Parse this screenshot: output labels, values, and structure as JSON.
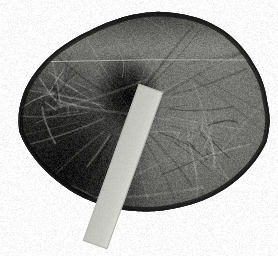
{
  "image": {
    "title": "Grayscale specimen photograph with scale bar",
    "kind": "natural-image",
    "width": 278,
    "height": 256,
    "background_color": "#ffffff",
    "description": "Grayscale close-up photograph of a rounded organic specimen resembling a leaf or biological tissue, photographed against a plain white background, with a light gray rectangular scale marker laid diagonally across it."
  },
  "specimen": {
    "name": "organic-specimen",
    "shape": "rounded irregular oval",
    "orientation_note": "wider than tall, apex toward upper center, tapering toward lower left",
    "surface": "matte, wrinkled, with vein-like striations and shallow folds",
    "rim_color": "#1a1a1a",
    "body_dark_color": "#2e2e2e",
    "body_mid_color": "#5a5a58",
    "body_light_color": "#8f8f8a",
    "highlight_color": "#a8a8a2",
    "bounds": {
      "left": 22,
      "top": 12,
      "right": 268,
      "bottom": 220
    },
    "features": [
      {
        "name": "central-depression",
        "label": "Dark central hollow",
        "center_x": 128,
        "center_y": 96,
        "radius_x": 34,
        "radius_y": 44,
        "color": "#141414"
      },
      {
        "name": "horizontal-crack-line",
        "label": "Thin light fissure crossing specimen",
        "start_x": 28,
        "start_y": 62,
        "end_x": 266,
        "end_y": 60,
        "color": "#b9b9b4",
        "thickness": 1
      },
      {
        "name": "vein-cluster-left",
        "label": "Vein striations, left flank",
        "center_x": 60,
        "center_y": 92
      },
      {
        "name": "vein-cluster-right",
        "label": "Vein striations, right flank",
        "center_x": 196,
        "center_y": 140
      },
      {
        "name": "shadow-lower-left",
        "label": "Deep shadow along lower-left margin",
        "center_x": 62,
        "center_y": 170
      }
    ]
  },
  "scale_bar": {
    "name": "scale-bar-marker",
    "label": "Rectangular scale marker",
    "color": "#c9c9c4",
    "edge_color": "#b0b0ab",
    "top_x": 151,
    "top_y": 88,
    "bottom_x": 95,
    "bottom_y": 245,
    "bar_width": 26,
    "rotation_degrees": 19.6,
    "extends_past_specimen": true
  },
  "colors": {
    "page_background": "#ffffff",
    "darkest": "#0d0d0d",
    "midtone": "#5a5a58",
    "lightest": "#d6d6d1",
    "marker": "#c9c9c4"
  }
}
